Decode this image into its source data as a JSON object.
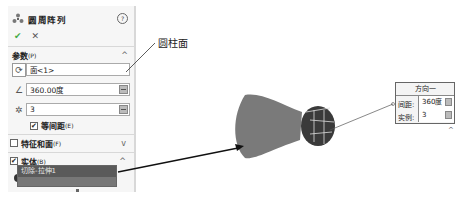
{
  "panel": {
    "title": "圆周阵列",
    "help_icon": "?",
    "ok_icon": "✔",
    "cancel_icon": "✕",
    "parameters": {
      "label": "参数",
      "shortcut": "(P)",
      "axis_value": "面<1>",
      "angle_value": "360.00度",
      "instances_value": "3",
      "equal_spacing_label": "等间距",
      "equal_spacing_shortcut": "(E)",
      "equal_spacing_checked": true
    },
    "features_faces": {
      "label": "特征和面",
      "shortcut": "(F)",
      "checked": false
    },
    "bodies": {
      "label": "实体",
      "shortcut": "(B)",
      "checked": true,
      "selected_item": "切除-拉伸1"
    }
  },
  "callout": {
    "label": "圆柱面"
  },
  "direction_box": {
    "title": "方向一",
    "spacing_label": "间距:",
    "spacing_value": "360度",
    "instances_label": "实例:",
    "instances_value": "3"
  },
  "colors": {
    "panel_bg": "#f6f6f6",
    "body_fill": "#7d7d7d",
    "selection_bg": "#5a5a5a"
  }
}
